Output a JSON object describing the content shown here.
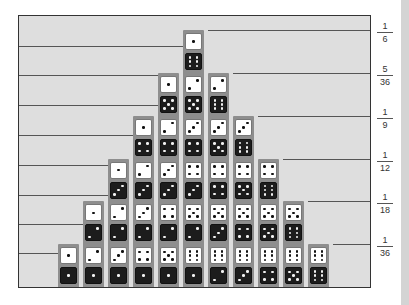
{
  "chart_data": {
    "type": "bar",
    "title": "",
    "xlabel": "Sum of two dice",
    "ylabel": "Probability",
    "categories": [
      "2",
      "3",
      "4",
      "5",
      "6",
      "7",
      "8",
      "9",
      "10",
      "11",
      "12"
    ],
    "values": [
      1,
      2,
      3,
      4,
      5,
      6,
      5,
      4,
      3,
      2,
      1
    ],
    "probabilities": [
      "1/36",
      "1/18",
      "1/12",
      "1/9",
      "5/36",
      "1/6",
      "5/36",
      "1/9",
      "1/12",
      "1/18",
      "1/36"
    ],
    "y_tick_labels": [
      {
        "num": "1",
        "den": "6"
      },
      {
        "num": "5",
        "den": "36"
      },
      {
        "num": "1",
        "den": "9"
      },
      {
        "num": "1",
        "den": "12"
      },
      {
        "num": "1",
        "den": "18"
      },
      {
        "num": "1",
        "den": "36"
      }
    ],
    "grid": true,
    "dice_columns": [
      [
        [
          1,
          1
        ]
      ],
      [
        [
          2,
          1
        ],
        [
          1,
          2
        ]
      ],
      [
        [
          3,
          1
        ],
        [
          2,
          2
        ],
        [
          1,
          3
        ]
      ],
      [
        [
          4,
          1
        ],
        [
          3,
          2
        ],
        [
          2,
          3
        ],
        [
          1,
          4
        ]
      ],
      [
        [
          5,
          1
        ],
        [
          4,
          2
        ],
        [
          3,
          3
        ],
        [
          2,
          4
        ],
        [
          1,
          5
        ]
      ],
      [
        [
          6,
          1
        ],
        [
          5,
          2
        ],
        [
          4,
          3
        ],
        [
          3,
          4
        ],
        [
          2,
          5
        ],
        [
          1,
          6
        ]
      ],
      [
        [
          6,
          2
        ],
        [
          5,
          3
        ],
        [
          4,
          4
        ],
        [
          3,
          5
        ],
        [
          2,
          6
        ]
      ],
      [
        [
          6,
          3
        ],
        [
          5,
          4
        ],
        [
          4,
          5
        ],
        [
          3,
          6
        ]
      ],
      [
        [
          6,
          4
        ],
        [
          5,
          5
        ],
        [
          4,
          6
        ]
      ],
      [
        [
          6,
          5
        ],
        [
          5,
          6
        ]
      ],
      [
        [
          6,
          6
        ]
      ]
    ],
    "dice_pair_order": "white (top) / black (bottom), stacked bottom to top",
    "colors": {
      "background": "#dedede",
      "column": "#8e8e8e",
      "white_die": "#ffffff",
      "black_die": "#1c1c1c",
      "gridline": "#555555"
    }
  }
}
